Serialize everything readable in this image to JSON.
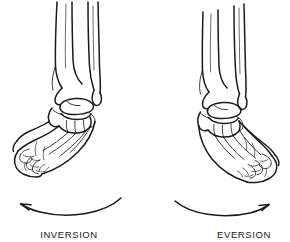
{
  "figure": {
    "background_color": "#ffffff",
    "ink_color": "#1a1a1a",
    "style": "anatomical line drawing"
  },
  "panels": [
    {
      "id": "left",
      "label": "INVERSION",
      "subject": "right ankle and foot skeleton, anterior view, sole turned medially",
      "arrow": {
        "name": "curved-arrow-left",
        "direction": "leftward",
        "arrowhead_side": "left",
        "curvature": "arc opening upward"
      },
      "structures": [
        "tibia",
        "fibula",
        "talus",
        "calcaneus",
        "navicular",
        "cuneiforms",
        "cuboid",
        "metatarsals",
        "phalanges"
      ]
    },
    {
      "id": "right",
      "label": "EVERSION",
      "subject": "right ankle and foot skeleton, anterior view, sole turned laterally",
      "arrow": {
        "name": "curved-arrow-right",
        "direction": "rightward",
        "arrowhead_side": "right",
        "curvature": "arc opening upward"
      },
      "structures": [
        "tibia",
        "fibula",
        "talus",
        "calcaneus",
        "navicular",
        "cuneiforms",
        "cuboid",
        "metatarsals",
        "phalanges"
      ]
    }
  ]
}
